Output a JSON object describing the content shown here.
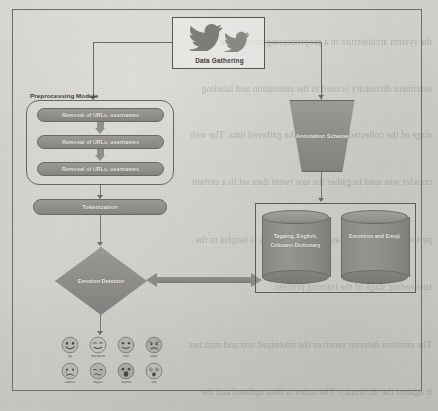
{
  "background": {
    "ghost_text_note": "faded mirrored bleed-through text from reverse side of scanned page",
    "ghost_lines": [
      "the system architecture in a preprocessing module the",
      "sentiment dictionary is used in the annotation and labeling",
      "stage of the collected tweets from the gathered data. The web",
      "crawler was used to gather the raw tweet data set in a certain",
      "period. The annotation and labeling process is helpful to the",
      "succeeding stage of the training process.",
      "The emotion detector receives the tokenized text and matches",
      "it against the dictionary. The index is then updated and the",
      "emotion label is assigned using the emoticon and emoji table."
    ]
  },
  "diagram": {
    "data_gathering": {
      "label": "Data Gathering",
      "icon": "twitter-bird-icon"
    },
    "preprocessing": {
      "title": "Preprocessing Module",
      "steps": [
        {
          "label": "Removal of URLs, usernames"
        },
        {
          "label": "Removal of URLs, usernames"
        },
        {
          "label": "Removal of URLs, usernames"
        }
      ]
    },
    "tokenization": {
      "label": "Tokenization"
    },
    "annotation": {
      "label": "Annotation Scheme"
    },
    "emotion_detector": {
      "label": "Emotion Detector"
    },
    "databases": [
      {
        "label": "Tagalog, English, Cebuano Dictionary"
      },
      {
        "label": "Emoticon and Emoji"
      }
    ],
    "emotions": [
      {
        "caption": "joy",
        "face": "joy-emoji"
      },
      {
        "caption": "anticipation",
        "face": "anticipation-emoji"
      },
      {
        "caption": "trust",
        "face": "trust-emoji"
      },
      {
        "caption": "anger",
        "face": "anger-emoji"
      },
      {
        "caption": "sadness",
        "face": "sadness-emoji"
      },
      {
        "caption": "disgust",
        "face": "disgust-emoji"
      },
      {
        "caption": "surprise",
        "face": "surprise-emoji"
      },
      {
        "caption": "fear",
        "face": "fear-emoji"
      }
    ]
  },
  "colors": {
    "paper": "#cfcdc9",
    "shape_fill": "#908e8a",
    "shape_border": "#6a6865",
    "line": "#6c6a66",
    "shape_text": "#efeeec",
    "body_text": "#3b3937"
  }
}
